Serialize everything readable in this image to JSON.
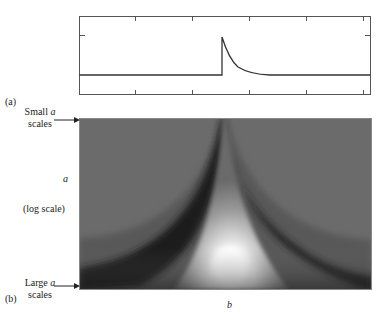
{
  "panel_a": {
    "label": "(a)",
    "description": "Signal: flat baseline with a sudden jump at center followed by exponential decay back to baseline"
  },
  "panel_b": {
    "label": "(b)",
    "small_scale_label_line1": "Small a",
    "small_scale_label_line1_prefix": "Small ",
    "small_scale_label_var": "a",
    "small_scale_label_line2": "scales",
    "large_scale_label_prefix": "Large ",
    "large_scale_label_var": "a",
    "large_scale_label_line2": "scales",
    "y_axis_var": "a",
    "y_axis_note": "(log scale)",
    "x_axis_var": "b",
    "description": "Wavelet transform scalogram (grayscale) showing cone of influence converging to the discontinuity at the center for small scales"
  },
  "colors": {
    "background_gray": "#6b6b6b",
    "dark_band": "#1a1a1a",
    "bright_peak": "#ffffff",
    "line": "#333333"
  }
}
